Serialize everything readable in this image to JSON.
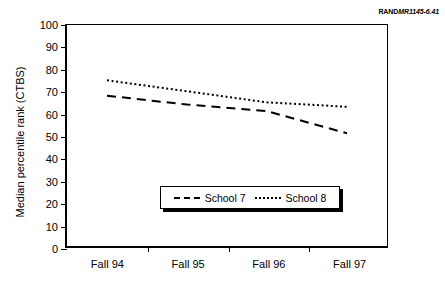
{
  "figure_label": {
    "prefix": "RAND",
    "number": "MR1145-6.41"
  },
  "legend": {
    "entries": [
      {
        "label": "School 7",
        "style": "dashed"
      },
      {
        "label": "School 8",
        "style": "dotted"
      }
    ]
  },
  "chart_data": {
    "type": "line",
    "title": "",
    "xlabel": "",
    "ylabel": "Median percentile rank (CTBS)",
    "categories": [
      "Fall 94",
      "Fall 95",
      "Fall 96",
      "Fall 97"
    ],
    "ylim": [
      0,
      100
    ],
    "yticks": [
      0,
      10,
      20,
      30,
      40,
      50,
      60,
      70,
      80,
      90,
      100
    ],
    "grid": false,
    "legend_position": "inside-bottom-center",
    "series": [
      {
        "name": "School 7",
        "style": "dashed",
        "color": "#000000",
        "values": [
          68,
          64,
          61,
          51
        ]
      },
      {
        "name": "School 8",
        "style": "dotted",
        "color": "#000000",
        "values": [
          75,
          70,
          65,
          63
        ]
      }
    ]
  }
}
